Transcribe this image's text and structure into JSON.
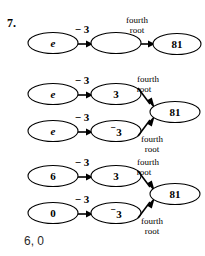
{
  "problem": {
    "number": "7.",
    "answer": "6, 0"
  },
  "labels": {
    "minus_three": "− 3",
    "fourth": "fourth",
    "root": "root",
    "eighty_one": "81",
    "e": "e",
    "three": "3",
    "neg_three_sup": "⁻",
    "neg_three_digit": "3",
    "six": "6",
    "zero": "0",
    "empty": ""
  },
  "colors": {
    "background": "#ffffff",
    "ink": "#000000",
    "answer_ink": "#2a2a2a"
  },
  "diagram": {
    "type": "flow-diagram",
    "groups": [
      {
        "id": "group-1",
        "rows": [
          {
            "start_label": "e",
            "operation_label": "− 3",
            "middle_label": "",
            "second_operation_top": "fourth",
            "second_operation_bottom": "root",
            "result_label": "81"
          }
        ]
      },
      {
        "id": "group-2",
        "rows": [
          {
            "start_label": "e",
            "operation_label": "− 3",
            "middle_label": "3",
            "second_operation_top": "fourth",
            "second_operation_bottom": "root",
            "result_label": "81"
          },
          {
            "start_label": "e",
            "operation_label": "− 3",
            "middle_label": "⁻3",
            "second_operation_top": "fourth",
            "second_operation_bottom": "root",
            "result_label": "81"
          }
        ]
      },
      {
        "id": "group-3",
        "rows": [
          {
            "start_label": "6",
            "operation_label": "− 3",
            "middle_label": "3",
            "second_operation_top": "fourth",
            "second_operation_bottom": "root",
            "result_label": "81"
          },
          {
            "start_label": "0",
            "operation_label": "− 3",
            "middle_label": "⁻3",
            "second_operation_top": "fourth",
            "second_operation_bottom": "root",
            "result_label": "81"
          }
        ]
      }
    ]
  }
}
